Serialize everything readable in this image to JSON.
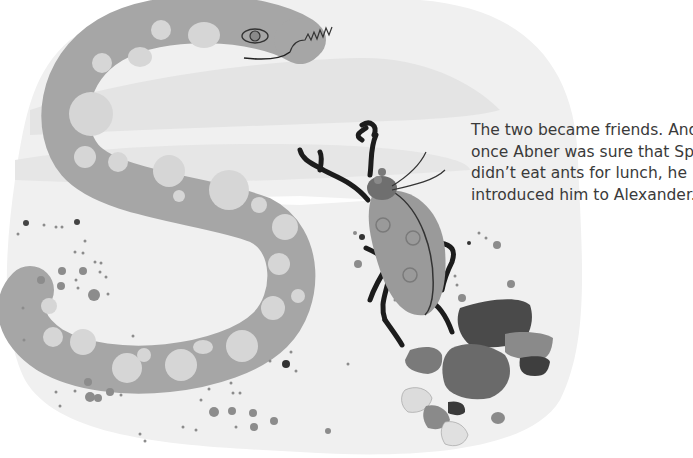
{
  "page": {
    "story_lines": [
      "The two became friends. And",
      "once Abner was sure that Spotty",
      "didn’t eat ants for lunch, he",
      "introduced him to Alexander."
    ]
  },
  "illustration": {
    "characters": [
      "snake-abner",
      "beetle-spotty"
    ],
    "colors": {
      "background_blob": "#f0f0f0",
      "ground_band": "#e3e3e3",
      "snake_body": "#a6a6a6",
      "snake_spots": "#d6d6d6",
      "beetle_shell": "#9a9a9a",
      "beetle_head": "#6f6f6f",
      "beetle_legs": "#1c1c1c",
      "rock_dark": "#4a4a4a",
      "rock_mid": "#6e6e6e",
      "rock_light": "#dcdcdc"
    }
  }
}
